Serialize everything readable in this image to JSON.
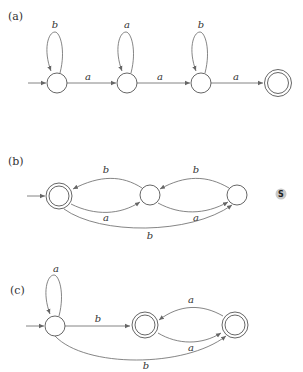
{
  "figure": {
    "parts": [
      {
        "id": "a",
        "label": "(a)",
        "states": [
          {
            "id": "a0",
            "start": true,
            "accepting": false
          },
          {
            "id": "a1",
            "start": false,
            "accepting": false
          },
          {
            "id": "a2",
            "start": false,
            "accepting": false
          },
          {
            "id": "a3",
            "start": false,
            "accepting": true
          }
        ],
        "transitions": [
          {
            "from": "a0",
            "to": "a0",
            "symbol": "b"
          },
          {
            "from": "a0",
            "to": "a1",
            "symbol": "a"
          },
          {
            "from": "a1",
            "to": "a1",
            "symbol": "a"
          },
          {
            "from": "a1",
            "to": "a2",
            "symbol": "a"
          },
          {
            "from": "a2",
            "to": "a2",
            "symbol": "b"
          },
          {
            "from": "a2",
            "to": "a3",
            "symbol": "a"
          }
        ]
      },
      {
        "id": "b",
        "label": "(b)",
        "states": [
          {
            "id": "b0",
            "start": true,
            "accepting": true
          },
          {
            "id": "b1",
            "start": false,
            "accepting": false
          },
          {
            "id": "b2",
            "start": false,
            "accepting": false
          }
        ],
        "transitions": [
          {
            "from": "b1",
            "to": "b0",
            "symbol": "b"
          },
          {
            "from": "b0",
            "to": "b1",
            "symbol": "a"
          },
          {
            "from": "b2",
            "to": "b1",
            "symbol": "b"
          },
          {
            "from": "b1",
            "to": "b2",
            "symbol": "a"
          },
          {
            "from": "b0",
            "to": "b2",
            "symbol": "b"
          }
        ]
      },
      {
        "id": "c",
        "label": "(c)",
        "states": [
          {
            "id": "c0",
            "start": true,
            "accepting": false
          },
          {
            "id": "c1",
            "start": false,
            "accepting": true
          },
          {
            "id": "c2",
            "start": false,
            "accepting": true
          }
        ],
        "transitions": [
          {
            "from": "c0",
            "to": "c0",
            "symbol": "a"
          },
          {
            "from": "c0",
            "to": "c1",
            "symbol": "b"
          },
          {
            "from": "c2",
            "to": "c1",
            "symbol": "a"
          },
          {
            "from": "c1",
            "to": "c2",
            "symbol": "a"
          },
          {
            "from": "c0",
            "to": "c2",
            "symbol": "b"
          }
        ]
      }
    ]
  },
  "badge": {
    "text": "S",
    "color": "#c9c9c9"
  },
  "colors": {
    "stroke": "#555555",
    "text": "#333333"
  }
}
